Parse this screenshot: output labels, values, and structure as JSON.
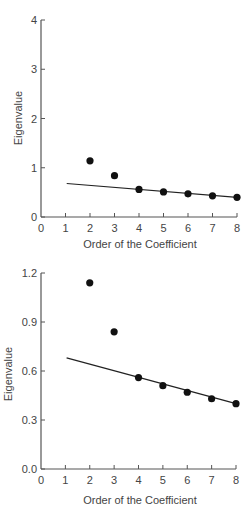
{
  "chart_data": [
    {
      "type": "scatter",
      "title": "",
      "xlabel": "Order of the Coefficient",
      "ylabel": "Eigenvalue",
      "xlim": [
        0,
        8
      ],
      "ylim": [
        0,
        4
      ],
      "xticks": [
        "0",
        "1",
        "2",
        "3",
        "4",
        "5",
        "6",
        "7",
        "8"
      ],
      "yticks": [
        "0",
        "1",
        "2",
        "3",
        "4"
      ],
      "grid": false,
      "legend": null,
      "series": [
        {
          "name": "Eigenvalues",
          "kind": "points",
          "x": [
            2,
            3,
            4,
            5,
            6,
            7,
            8
          ],
          "y": [
            1.14,
            0.84,
            0.56,
            0.51,
            0.47,
            0.43,
            0.4
          ]
        },
        {
          "name": "Fitted line",
          "kind": "line",
          "x": [
            1.05,
            8
          ],
          "y": [
            0.68,
            0.4
          ]
        }
      ]
    },
    {
      "type": "scatter",
      "title": "",
      "xlabel": "Order of the Coefficient",
      "ylabel": "Eigenvalue",
      "xlim": [
        0,
        8
      ],
      "ylim": [
        0.0,
        1.2
      ],
      "xticks": [
        "0",
        "1",
        "2",
        "3",
        "4",
        "5",
        "6",
        "7",
        "8"
      ],
      "yticks": [
        "0.0",
        "0.3",
        "0.6",
        "0.9",
        "1.2"
      ],
      "grid": false,
      "legend": null,
      "series": [
        {
          "name": "Eigenvalues",
          "kind": "points",
          "x": [
            2,
            3,
            4,
            5,
            6,
            7,
            8
          ],
          "y": [
            1.14,
            0.84,
            0.56,
            0.51,
            0.47,
            0.43,
            0.4
          ]
        },
        {
          "name": "Fitted line",
          "kind": "line",
          "x": [
            1.05,
            8
          ],
          "y": [
            0.68,
            0.4
          ]
        }
      ]
    }
  ]
}
